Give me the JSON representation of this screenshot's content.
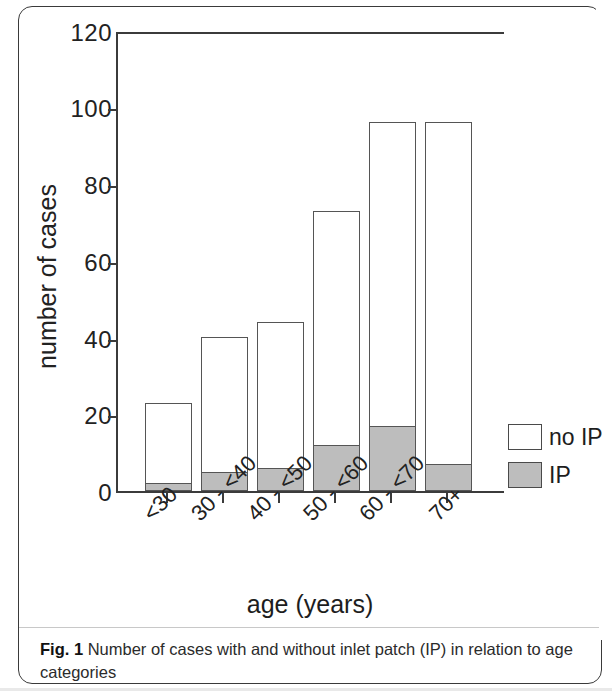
{
  "figure": {
    "caption_prefix": "Fig. 1",
    "caption_text": " Number of cases with and without inlet patch (IP) in relation to age categories"
  },
  "legend": {
    "position": "right",
    "entries": [
      {
        "label": "no IP",
        "color": "#ffffff"
      },
      {
        "label": "IP",
        "color": "#bdbdbd"
      }
    ]
  },
  "axis": {
    "y_title": "number of cases",
    "x_title": "age (years)",
    "y_ticks": [
      "0",
      "20",
      "40",
      "60",
      "80",
      "100",
      "120"
    ],
    "x_ticks": [
      "<30",
      "30 - <40",
      "40 - <50",
      "50 - <60",
      "60 - <70",
      "70+"
    ]
  },
  "chart_data": {
    "type": "bar",
    "title": "Number of cases with and without inlet patch (IP) in relation to age categories",
    "xlabel": "age (years)",
    "ylabel": "number of cases",
    "categories": [
      "<30",
      "30 - <40",
      "40 - <50",
      "50 - <60",
      "60 - <70",
      "70+"
    ],
    "stacked": true,
    "series": [
      {
        "name": "IP",
        "color": "#bdbdbd",
        "values": [
          2,
          5,
          6,
          12,
          17,
          7
        ]
      },
      {
        "name": "no IP",
        "color": "#ffffff",
        "values": [
          21,
          35,
          38,
          61,
          79,
          89
        ]
      }
    ],
    "totals": [
      23,
      40,
      44,
      73,
      96,
      96
    ],
    "ylim": [
      0,
      120
    ],
    "ytick_step": 20,
    "grid": false,
    "legend_position": "right"
  }
}
